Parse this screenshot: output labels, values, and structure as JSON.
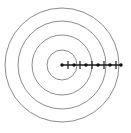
{
  "figure": {
    "background_color": "#ffffff",
    "width": 131,
    "height": 133
  },
  "chart_data": {
    "type": "scatter",
    "xlabel": "",
    "ylabel": "",
    "grid": false,
    "legend": false,
    "center": {
      "x": 62,
      "y": 65
    },
    "circle_color": "#6e6e6e",
    "circle_stroke_width": 0.8,
    "ray_color": "#1a1a1a",
    "circles": [
      {
        "index": 1,
        "radius": 15
      },
      {
        "index": 2,
        "radius": 30
      },
      {
        "index": 3,
        "radius": 44
      },
      {
        "index": 4,
        "radius": 57
      }
    ],
    "ray": {
      "angle_degrees": 0,
      "start_x": 62,
      "end_x": 122,
      "y": 65,
      "length": 60,
      "tick_half_height": 4
    },
    "dots": [
      {
        "index": 0,
        "x": 62,
        "radius_from_center": 0
      },
      {
        "index": 1,
        "x": 74,
        "radius_from_center": 12
      },
      {
        "index": 2,
        "x": 86,
        "radius_from_center": 24
      },
      {
        "index": 3,
        "x": 98,
        "radius_from_center": 36
      },
      {
        "index": 4,
        "x": 110,
        "radius_from_center": 48
      },
      {
        "index": 5,
        "x": 121,
        "radius_from_center": 59
      }
    ],
    "ticks": [
      {
        "index": 1,
        "x": 68,
        "radius_from_center": 6
      },
      {
        "index": 2,
        "x": 80,
        "radius_from_center": 18
      },
      {
        "index": 3,
        "x": 92,
        "radius_from_center": 30
      },
      {
        "index": 4,
        "x": 104,
        "radius_from_center": 42
      },
      {
        "index": 5,
        "x": 116,
        "radius_from_center": 54
      }
    ],
    "dot_radius": 1.7
  }
}
